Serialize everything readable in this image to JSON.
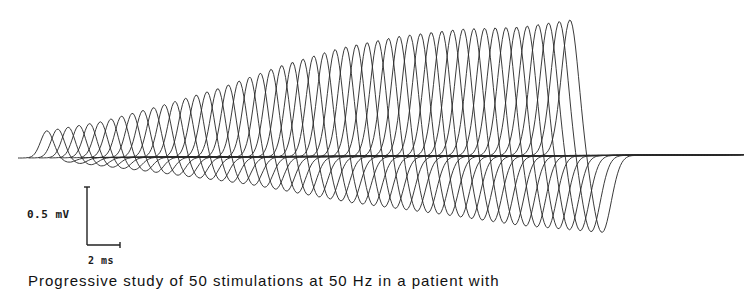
{
  "chart_data": {
    "type": "line",
    "title": "",
    "series_count": 50,
    "trace_shape": "biphasic (positive peak followed by negative trough)",
    "scale_bar": {
      "vertical": {
        "value": 0.5,
        "unit": "mV",
        "label": "0.5 mV"
      },
      "horizontal": {
        "value": 2,
        "unit": "ms",
        "label": "2 ms"
      }
    },
    "first_response": {
      "relative_peak_amplitude_mV": 0.2,
      "relative_trough_amplitude_mV": 0.03
    },
    "last_response": {
      "relative_peak_amplitude_mV": 1.2,
      "relative_trough_amplitude_mV": 0.6
    },
    "envelope": {
      "peak_px": [
        [
          47,
          131
        ],
        [
          100,
          122
        ],
        [
          160,
          106
        ],
        [
          220,
          88
        ],
        [
          280,
          66
        ],
        [
          340,
          48
        ],
        [
          400,
          36
        ],
        [
          460,
          29
        ],
        [
          520,
          27
        ],
        [
          570,
          20
        ]
      ],
      "trough_px": [
        [
          47,
          160
        ],
        [
          150,
          172
        ],
        [
          250,
          185
        ],
        [
          350,
          203
        ],
        [
          450,
          216
        ],
        [
          520,
          226
        ],
        [
          600,
          233
        ]
      ]
    },
    "grid": false,
    "legend": null,
    "xlabel": "",
    "ylabel": ""
  },
  "labels": {
    "voltage_scale": "0.5 mV",
    "time_scale": "2 ms"
  },
  "caption": "Progressive study of 50 stimulations at 50 Hz in a patient with"
}
